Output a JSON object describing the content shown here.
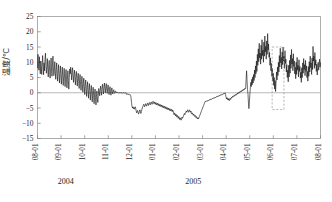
{
  "chart_data": {
    "type": "line",
    "title": "",
    "xlabel": "",
    "ylabel": "温度/℃",
    "ylim": [
      -15,
      25
    ],
    "yticks": [
      25,
      20,
      15,
      10,
      5,
      0,
      -5,
      -10,
      -15
    ],
    "ytick_labels": [
      "25",
      "20",
      "15",
      "10",
      "5",
      "0",
      "−5",
      "−10",
      "−15"
    ],
    "xtick_labels": [
      "08-01",
      "09-01",
      "10-01",
      "11-01",
      "12-01",
      "01-01",
      "02-01",
      "03-01",
      "04-01",
      "05-01",
      "06-01",
      "07-01",
      "08-01"
    ],
    "grid": false,
    "legend": null,
    "zero_line": 0,
    "period_labels": [
      {
        "label": "2004",
        "x_index": 1.2
      },
      {
        "label": "2005",
        "x_index": 6.6
      }
    ],
    "annotations": [
      {
        "kind": "dashed-rectangle",
        "x_start_index": 9.95,
        "x_end_index": 10.45,
        "y_top": 15.0,
        "y_bottom": -5.5
      }
    ],
    "series": [
      {
        "name": "温度",
        "color": "#111111",
        "values": [
          8.2,
          12.6,
          9.1,
          7.4,
          11.8,
          8.0,
          6.2,
          10.4,
          8.8,
          6.0,
          9.4,
          12.2,
          8.6,
          5.9,
          9.8,
          7.2,
          10.8,
          13.0,
          9.0,
          6.4,
          8.4,
          11.2,
          7.6,
          5.2,
          8.8,
          10.6,
          7.0,
          4.8,
          8.2,
          11.4,
          7.8,
          5.4,
          9.0,
          12.0,
          8.2,
          5.6,
          7.8,
          10.2,
          6.8,
          4.4,
          7.6,
          9.8,
          6.2,
          3.8,
          6.8,
          9.2,
          6.0,
          3.2,
          6.4,
          8.8,
          5.4,
          2.8,
          6.0,
          8.4,
          5.0,
          2.4,
          5.6,
          8.0,
          4.8,
          2.0,
          5.2,
          7.6,
          4.4,
          1.6,
          4.8,
          7.2,
          4.0,
          1.2,
          5.0,
          7.8,
          6.2,
          8.4,
          6.6,
          4.2,
          6.8,
          8.2,
          5.6,
          3.4,
          6.0,
          7.4,
          5.0,
          2.6,
          5.4,
          7.0,
          4.6,
          2.2,
          4.8,
          6.4,
          3.8,
          1.4,
          4.2,
          6.0,
          3.2,
          0.8,
          3.6,
          5.4,
          2.6,
          0.2,
          3.0,
          4.8,
          2.0,
          -0.6,
          2.4,
          4.2,
          1.4,
          -1.2,
          1.8,
          3.6,
          0.8,
          -1.8,
          1.2,
          3.0,
          0.2,
          -2.4,
          0.6,
          2.4,
          -0.4,
          -3.0,
          0.0,
          1.8,
          -1.0,
          -3.6,
          -0.6,
          1.2,
          -1.6,
          -4.0,
          -1.2,
          0.6,
          -2.0,
          -3.2,
          -0.8,
          1.4,
          0.2,
          -1.0,
          1.0,
          2.2,
          0.4,
          -0.8,
          1.6,
          2.8,
          1.0,
          -0.4,
          1.8,
          3.2,
          1.4,
          0.0,
          2.0,
          3.0,
          1.2,
          -0.2,
          1.6,
          2.6,
          0.8,
          -0.6,
          1.2,
          2.0,
          0.4,
          -0.8,
          0.8,
          1.6,
          0.2,
          -0.4,
          0.6,
          1.0,
          0.0,
          -0.2,
          0.4,
          0.6,
          0.0,
          0.2,
          0.0,
          0.1,
          0.0,
          -0.1,
          0.0,
          0.0,
          0.0,
          0.0,
          0.0,
          0.0,
          0.0,
          -0.2,
          0.0,
          0.1,
          0.0,
          0.0,
          -0.1,
          0.0,
          0.0,
          0.0,
          -0.4,
          -0.6,
          -0.3,
          -0.5,
          -0.4,
          -0.6,
          -0.5,
          -0.7,
          -0.6,
          -0.8,
          -1.6,
          -3.2,
          -4.4,
          -5.0,
          -4.6,
          -5.2,
          -4.8,
          -5.4,
          -5.0,
          -4.6,
          -5.2,
          -6.0,
          -6.6,
          -6.2,
          -5.8,
          -6.4,
          -7.0,
          -6.6,
          -6.0,
          -5.6,
          -6.2,
          -6.8,
          -6.2,
          -5.6,
          -5.0,
          -4.6,
          -4.2,
          -3.8,
          -4.2,
          -4.6,
          -4.0,
          -3.6,
          -4.0,
          -4.4,
          -3.8,
          -3.4,
          -3.8,
          -4.2,
          -3.6,
          -3.2,
          -3.6,
          -4.0,
          -3.4,
          -3.0,
          -3.4,
          -3.8,
          -3.2,
          -2.8,
          -3.2,
          -3.6,
          -3.0,
          -3.4,
          -3.8,
          -3.2,
          -3.6,
          -4.0,
          -3.4,
          -3.8,
          -4.2,
          -3.6,
          -4.0,
          -4.4,
          -3.8,
          -4.2,
          -4.6,
          -4.0,
          -4.4,
          -4.8,
          -4.2,
          -4.6,
          -5.0,
          -4.4,
          -4.8,
          -5.2,
          -4.6,
          -5.0,
          -5.4,
          -4.8,
          -5.2,
          -5.6,
          -5.0,
          -5.4,
          -5.8,
          -5.2,
          -5.6,
          -6.0,
          -5.4,
          -5.8,
          -6.2,
          -5.6,
          -6.0,
          -6.6,
          -7.2,
          -6.6,
          -7.0,
          -7.6,
          -7.0,
          -7.4,
          -8.0,
          -7.4,
          -7.8,
          -8.4,
          -7.8,
          -8.2,
          -8.8,
          -8.2,
          -8.6,
          -9.0,
          -8.4,
          -8.0,
          -8.4,
          -8.0,
          -7.6,
          -7.2,
          -6.8,
          -7.2,
          -6.8,
          -6.4,
          -6.0,
          -6.4,
          -6.0,
          -5.6,
          -6.0,
          -6.4,
          -6.0,
          -5.6,
          -6.0,
          -6.4,
          -6.0,
          -6.6,
          -7.0,
          -6.6,
          -7.0,
          -7.4,
          -7.0,
          -7.4,
          -7.8,
          -7.4,
          -7.8,
          -8.2,
          -7.8,
          -8.2,
          -8.6,
          -8.2,
          -8.6,
          -8.2,
          -7.8,
          -7.4,
          -7.0,
          -6.6,
          -6.2,
          -5.8,
          -5.4,
          -5.0,
          -4.6,
          -4.2,
          -3.8,
          -3.4,
          -3.0,
          -2.8,
          -3.0,
          -2.8,
          -2.6,
          -2.8,
          -2.6,
          -2.4,
          -2.6,
          -2.4,
          -2.2,
          -2.4,
          -2.2,
          -2.0,
          -2.2,
          -2.0,
          -1.8,
          -2.0,
          -1.8,
          -1.6,
          -1.8,
          -1.6,
          -1.4,
          -1.6,
          -1.4,
          -1.2,
          -1.4,
          -1.2,
          -1.0,
          -1.2,
          -1.0,
          -0.8,
          -1.0,
          -0.8,
          -0.6,
          -0.8,
          -0.6,
          -0.4,
          -0.6,
          -0.4,
          -0.2,
          -0.4,
          -0.2,
          0.0,
          -0.6,
          -1.4,
          -2.0,
          -1.6,
          -2.2,
          -1.8,
          -2.4,
          -2.0,
          -2.6,
          -2.2,
          -1.8,
          -2.2,
          -1.8,
          -1.4,
          -1.6,
          -1.2,
          -1.4,
          -1.0,
          -1.2,
          -0.8,
          -1.0,
          -0.6,
          -0.8,
          -0.4,
          -0.6,
          -0.2,
          -0.4,
          0.0,
          -0.2,
          0.2,
          0.0,
          0.4,
          0.2,
          0.6,
          0.4,
          0.8,
          0.6,
          1.0,
          0.8,
          1.2,
          1.0,
          1.4,
          1.2,
          1.6,
          4.4,
          7.2,
          4.0,
          1.0,
          -0.4,
          -3.4,
          -5.2,
          -3.0,
          -0.6,
          1.6,
          3.4,
          2.0,
          4.4,
          2.6,
          5.2,
          3.2,
          6.0,
          4.0,
          7.4,
          5.0,
          8.8,
          6.2,
          10.4,
          7.0,
          12.6,
          9.0,
          14.4,
          10.2,
          16.2,
          11.4,
          13.0,
          9.4,
          15.6,
          11.0,
          17.4,
          12.2,
          14.0,
          10.0,
          16.6,
          12.0,
          18.6,
          13.4,
          15.2,
          11.0,
          17.0,
          12.6,
          19.4,
          14.0,
          16.0,
          11.6,
          13.2,
          9.0,
          11.4,
          7.2,
          9.6,
          5.4,
          8.0,
          3.8,
          6.4,
          2.4,
          5.0,
          1.2,
          4.0,
          0.4,
          3.4,
          6.8,
          4.2,
          8.4,
          5.6,
          10.0,
          6.8,
          12.2,
          8.4,
          14.6,
          9.8,
          11.6,
          7.8,
          13.4,
          9.2,
          15.0,
          10.4,
          12.0,
          8.0,
          13.8,
          9.6,
          11.0,
          6.8,
          9.2,
          5.0,
          7.4,
          3.6,
          9.0,
          5.2,
          10.6,
          6.4,
          12.4,
          8.0,
          14.2,
          9.4,
          11.2,
          7.2,
          12.8,
          8.6,
          10.4,
          6.2,
          8.4,
          4.6,
          10.0,
          6.0,
          11.6,
          7.4,
          9.0,
          5.2,
          10.8,
          7.0,
          8.6,
          4.8,
          6.8,
          3.4,
          8.2,
          5.0,
          9.8,
          6.4,
          11.2,
          7.6,
          9.2,
          5.6,
          10.6,
          7.0,
          8.8,
          5.0,
          7.0,
          3.8,
          8.6,
          5.4,
          10.2,
          6.8,
          12.0,
          8.2,
          9.8,
          6.0,
          11.4,
          7.6,
          15.2,
          10.4,
          12.0,
          8.0,
          13.2,
          9.0,
          10.8,
          7.0,
          9.4,
          5.8,
          8.2,
          10.0,
          7.4,
          9.0,
          11.0,
          8.4,
          9.8
        ]
      }
    ]
  },
  "caption": ""
}
